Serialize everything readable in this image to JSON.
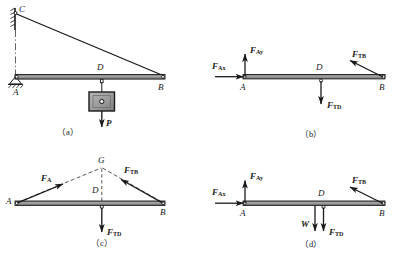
{
  "figure": {
    "type": "engineering-statics-free-body-diagrams",
    "panel_count": 4
  },
  "colors": {
    "line": "#1a1a1a",
    "beam_fill": "#8c8c8c",
    "block_fill": "#9a9a9a",
    "block_inner": "#c9c9c9",
    "background": "#ffffff",
    "dashed": "#3a3a3a"
  },
  "panels": [
    {
      "id": "a",
      "caption": "（a）",
      "description": "Beam AB pinned at A to a vertical wall, supported by cable CB; a block of weight P hangs from point D.",
      "points": [
        {
          "name": "C",
          "label": "C"
        },
        {
          "name": "A",
          "label": "A"
        },
        {
          "name": "D",
          "label": "D"
        },
        {
          "name": "B",
          "label": "B"
        }
      ],
      "forces": [
        {
          "name": "P",
          "label": "P",
          "direction": "down",
          "kind": "applied-load"
        }
      ],
      "members": [
        "wall",
        "cable-CB",
        "beam-AB",
        "hanger-D",
        "block",
        "centerline"
      ]
    },
    {
      "id": "b",
      "caption": "（b）",
      "description": "Free-body diagram of beam AB with pin reaction components at A, cable tension at B and hanger tension at D.",
      "points": [
        {
          "name": "A",
          "label": "A"
        },
        {
          "name": "D",
          "label": "D"
        },
        {
          "name": "B",
          "label": "B"
        }
      ],
      "forces": [
        {
          "name": "F_Ax",
          "base": "F",
          "sub": "Ax",
          "direction": "right",
          "at": "A"
        },
        {
          "name": "F_Ay",
          "base": "F",
          "sub": "Ay",
          "direction": "up",
          "at": "A"
        },
        {
          "name": "F_TB",
          "base": "F",
          "sub": "TB",
          "direction": "up-left",
          "at": "B"
        },
        {
          "name": "F_TD",
          "base": "F",
          "sub": "TD",
          "direction": "down",
          "at": "D"
        }
      ]
    },
    {
      "id": "c",
      "caption": "（c）",
      "description": "Three-force member solution: lines of action of F_A, F_TB and F_TD concur at point G above D.",
      "points": [
        {
          "name": "G",
          "label": "G"
        },
        {
          "name": "A",
          "label": "A"
        },
        {
          "name": "D",
          "label": "D"
        },
        {
          "name": "B",
          "label": "B"
        }
      ],
      "forces": [
        {
          "name": "F_A",
          "base": "F",
          "sub": "A",
          "direction": "up-right",
          "at": "A"
        },
        {
          "name": "F_TB",
          "base": "F",
          "sub": "TB",
          "direction": "up-left",
          "at": "B"
        },
        {
          "name": "F_TD",
          "base": "F",
          "sub": "TD",
          "direction": "down",
          "at": "D"
        }
      ],
      "construction": [
        "dashed-line-A-to-G",
        "dashed-line-G-to-B",
        "dashed-line-G-to-D"
      ]
    },
    {
      "id": "d",
      "caption": "（d）",
      "description": "Free-body diagram of beam AB including its own weight W acting at D together with the hanger tension F_TD.",
      "points": [
        {
          "name": "A",
          "label": "A"
        },
        {
          "name": "D",
          "label": "D"
        },
        {
          "name": "B",
          "label": "B"
        }
      ],
      "forces": [
        {
          "name": "F_Ax",
          "base": "F",
          "sub": "Ax",
          "direction": "right",
          "at": "A"
        },
        {
          "name": "F_Ay",
          "base": "F",
          "sub": "Ay",
          "direction": "up",
          "at": "A"
        },
        {
          "name": "F_TB",
          "base": "F",
          "sub": "TB",
          "direction": "up-left",
          "at": "B"
        },
        {
          "name": "W",
          "base": "W",
          "sub": "",
          "direction": "down",
          "at": "D"
        },
        {
          "name": "F_TD",
          "base": "F",
          "sub": "TD",
          "direction": "down",
          "at": "D"
        }
      ]
    }
  ],
  "labels": {
    "C": "C",
    "A": "A",
    "B": "B",
    "D": "D",
    "G": "G",
    "P": "P",
    "W": "W",
    "F": "F",
    "sub_Ax": "Ax",
    "sub_Ay": "Ay",
    "sub_TB": "TB",
    "sub_TD": "TD",
    "sub_A": "A",
    "cap_a": "（a）",
    "cap_b": "（b）",
    "cap_c": "（c）",
    "cap_d": "（d）"
  }
}
